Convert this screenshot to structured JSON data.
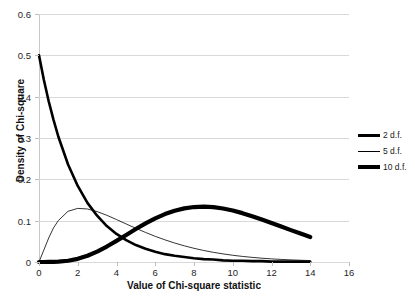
{
  "chart_data": {
    "type": "line",
    "title": "",
    "xlabel": "Value of Chi-square statistic",
    "ylabel": "Density of Chi-square",
    "xlim": [
      0,
      16
    ],
    "ylim": [
      0,
      0.6
    ],
    "xticks": [
      "0",
      "2",
      "4",
      "6",
      "8",
      "10",
      "12",
      "14",
      "16"
    ],
    "yticks": [
      "0",
      "0.1",
      "0.2",
      "0.3",
      "0.4",
      "0.5",
      "0.6"
    ],
    "grid": "horizontal",
    "legend_position": "right",
    "x": [
      0,
      0.25,
      0.5,
      0.75,
      1,
      1.5,
      2,
      2.5,
      3,
      3.5,
      4,
      4.5,
      5,
      5.5,
      6,
      6.5,
      7,
      7.5,
      8,
      8.5,
      9,
      9.5,
      10,
      10.5,
      11,
      11.5,
      12,
      12.5,
      13,
      13.5,
      14
    ],
    "series": [
      {
        "name": "2 d.f.",
        "color": "#000000",
        "width": 2.6,
        "values": [
          0.5,
          0.441,
          0.389,
          0.344,
          0.303,
          0.236,
          0.184,
          0.143,
          0.112,
          0.087,
          0.068,
          0.053,
          0.041,
          0.032,
          0.025,
          0.019,
          0.015,
          0.012,
          0.009,
          0.007,
          0.006,
          0.004,
          0.003,
          0.003,
          0.002,
          0.002,
          0.001,
          0.001,
          0.001,
          0.001,
          0.0005
        ]
      },
      {
        "name": "5 d.f.",
        "color": "#000000",
        "width": 0.8,
        "values": [
          0.0,
          0.0289,
          0.0581,
          0.0826,
          0.1004,
          0.1227,
          0.1297,
          0.1283,
          0.122,
          0.113,
          0.1027,
          0.092,
          0.0815,
          0.0715,
          0.0621,
          0.0536,
          0.0459,
          0.0391,
          0.0331,
          0.0279,
          0.0234,
          0.0196,
          0.0163,
          0.0135,
          0.0112,
          0.0092,
          0.0076,
          0.0062,
          0.0051,
          0.0042,
          0.0034
        ]
      },
      {
        "name": "10 d.f.",
        "color": "#000000",
        "width": 4.2,
        "values": [
          0.0,
          1e-05,
          0.0001,
          0.0004,
          0.0008,
          0.003,
          0.0077,
          0.0151,
          0.0252,
          0.0374,
          0.0511,
          0.0654,
          0.0798,
          0.0934,
          0.1056,
          0.1159,
          0.124,
          0.1297,
          0.133,
          0.1339,
          0.1326,
          0.1294,
          0.1245,
          0.1182,
          0.1109,
          0.1029,
          0.0944,
          0.0858,
          0.0771,
          0.0687,
          0.0605
        ]
      }
    ]
  },
  "legend": {
    "entries": [
      {
        "label": "2 d.f.",
        "thickness": 3
      },
      {
        "label": "5 d.f.",
        "thickness": 1
      },
      {
        "label": "10 d.f.",
        "thickness": 4
      }
    ]
  }
}
